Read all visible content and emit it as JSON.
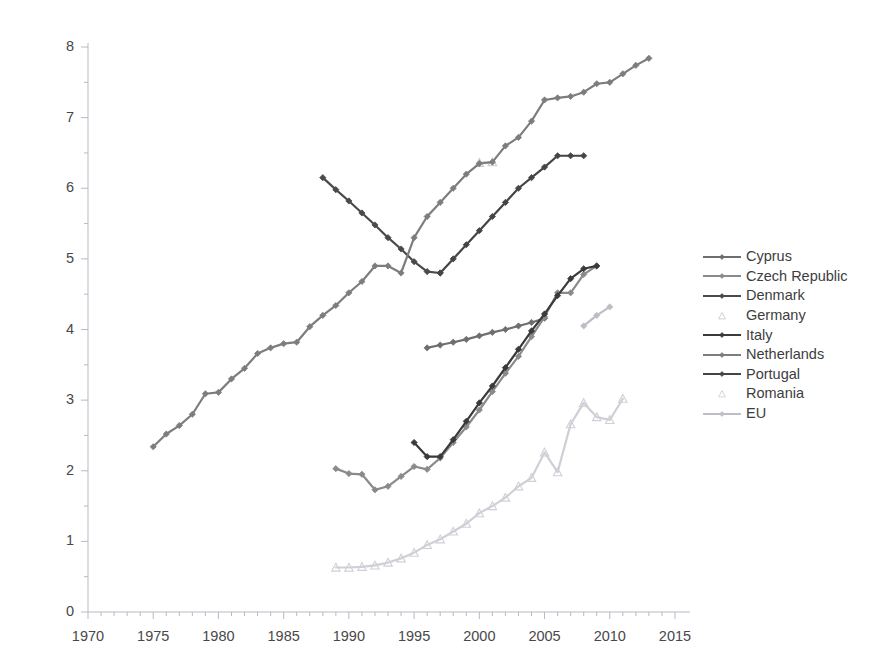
{
  "chart_data": {
    "type": "line",
    "title": "",
    "xlabel": "",
    "ylabel": "",
    "xlim": [
      1970,
      2015
    ],
    "ylim": [
      0,
      8
    ],
    "xticks": [
      1970,
      1975,
      1980,
      1985,
      1990,
      1995,
      2000,
      2005,
      2010,
      2015
    ],
    "yticks": [
      0,
      1,
      2,
      3,
      4,
      5,
      6,
      7,
      8
    ],
    "grid": false,
    "minor_xticks_every": 1,
    "minor_yticks_every": 0.5,
    "legend_position": "right",
    "series": [
      {
        "name": "Cyprus",
        "color": "#6e6e6e",
        "marker": "diamond",
        "x": [
          1996,
          1997,
          1998,
          1999,
          2000,
          2001,
          2002,
          2003,
          2004,
          2005
        ],
        "values": [
          3.74,
          3.78,
          3.82,
          3.86,
          3.91,
          3.96,
          4.0,
          4.05,
          4.1,
          4.16
        ]
      },
      {
        "name": "Czech Republic",
        "color": "#8a8a8a",
        "marker": "diamond",
        "x": [
          1989,
          1990,
          1991,
          1992,
          1993,
          1994,
          1995,
          1996,
          1997,
          1998,
          1999,
          2000,
          2001,
          2002,
          2003,
          2004,
          2005,
          2006,
          2007,
          2008,
          2009
        ],
        "values": [
          2.03,
          1.96,
          1.95,
          1.73,
          1.78,
          1.92,
          2.06,
          2.02,
          2.18,
          2.4,
          2.62,
          2.86,
          3.12,
          3.38,
          3.62,
          3.9,
          4.18,
          4.52,
          4.52,
          4.78,
          4.9
        ]
      },
      {
        "name": "Denmark",
        "color": "#4a4a4a",
        "marker": "diamond",
        "x": [
          1988,
          1989,
          1990,
          1991,
          1992,
          1993,
          1994,
          1995,
          1996,
          1997
        ],
        "values": [
          6.15,
          5.98,
          5.82,
          5.65,
          5.48,
          5.3,
          5.14,
          4.96,
          4.82,
          4.8
        ]
      },
      {
        "name": "Germany",
        "color": "#c9c9cf",
        "marker": "triangle",
        "x": [
          2000,
          2001
        ],
        "values": [
          6.36,
          6.37
        ]
      },
      {
        "name": "Italy",
        "color": "#3a3a3a",
        "marker": "diamond",
        "x": [
          1995,
          1996,
          1997,
          1998,
          1999,
          2000,
          2001,
          2002,
          2003,
          2004,
          2005,
          2006,
          2007,
          2008,
          2009
        ],
        "values": [
          2.4,
          2.2,
          2.2,
          2.44,
          2.7,
          2.96,
          3.2,
          3.46,
          3.72,
          3.98,
          4.22,
          4.48,
          4.72,
          4.86,
          4.9
        ]
      },
      {
        "name": "Netherlands",
        "color": "#7d7d7d",
        "marker": "diamond",
        "x": [
          1975,
          1976,
          1977,
          1978,
          1979,
          1980,
          1981,
          1982,
          1983,
          1984,
          1985,
          1986,
          1987,
          1988,
          1989,
          1990,
          1991,
          1992,
          1993,
          1994,
          1995,
          1996,
          1997,
          1998,
          1999,
          2000,
          2001,
          2002,
          2003,
          2004,
          2005,
          2006,
          2007,
          2008,
          2009,
          2010,
          2011,
          2012,
          2013
        ],
        "values": [
          2.34,
          2.52,
          2.64,
          2.8,
          3.09,
          3.11,
          3.3,
          3.45,
          3.66,
          3.74,
          3.8,
          3.82,
          4.04,
          4.2,
          4.34,
          4.52,
          4.68,
          4.9,
          4.9,
          4.8,
          5.3,
          5.6,
          5.8,
          6.0,
          6.2,
          6.35,
          6.37,
          6.6,
          6.72,
          6.95,
          7.25,
          7.28,
          7.3,
          7.36,
          7.48,
          7.5,
          7.62,
          7.74,
          7.84
        ]
      },
      {
        "name": "Portugal",
        "color": "#454545",
        "marker": "diamond",
        "x": [
          1997,
          1998,
          1999,
          2000,
          2001,
          2002,
          2003,
          2004,
          2005,
          2006,
          2007,
          2008
        ],
        "values": [
          4.8,
          5.0,
          5.2,
          5.4,
          5.6,
          5.8,
          6.0,
          6.15,
          6.3,
          6.46,
          6.46,
          6.46
        ]
      },
      {
        "name": "Romania",
        "color": "#cfcfd6",
        "marker": "triangle",
        "x": [
          1989,
          1990,
          1991,
          1992,
          1993,
          1994,
          1995,
          1996,
          1997,
          1998,
          1999,
          2000,
          2001,
          2002,
          2003,
          2004,
          2005,
          2006,
          2007,
          2008,
          2009,
          2010,
          2011
        ],
        "values": [
          0.63,
          0.63,
          0.64,
          0.66,
          0.7,
          0.76,
          0.84,
          0.95,
          1.03,
          1.14,
          1.25,
          1.4,
          1.5,
          1.62,
          1.78,
          1.9,
          2.26,
          1.98,
          2.66,
          2.96,
          2.76,
          2.72,
          3.02
        ]
      },
      {
        "name": "EU",
        "color": "#bdbdc6",
        "marker": "diamond",
        "x": [
          2008,
          2009,
          2010
        ],
        "values": [
          4.05,
          4.2,
          4.32
        ]
      }
    ]
  },
  "axes": {
    "y_tick_labels": [
      "8",
      "7",
      "6",
      "5",
      "4",
      "3",
      "2",
      "1",
      "0"
    ],
    "x_tick_labels": [
      "1970",
      "1975",
      "1980",
      "1985",
      "1990",
      "1995",
      "2000",
      "2005",
      "2010",
      "2015"
    ]
  },
  "legend": {
    "items": [
      {
        "label": "Cyprus",
        "color": "#6e6e6e",
        "marker": "diamond"
      },
      {
        "label": "Czech Republic",
        "color": "#8a8a8a",
        "marker": "diamond"
      },
      {
        "label": "Denmark",
        "color": "#4a4a4a",
        "marker": "diamond"
      },
      {
        "label": "Germany",
        "color": "#c9c9cf",
        "marker": "triangle"
      },
      {
        "label": "Italy",
        "color": "#3a3a3a",
        "marker": "diamond"
      },
      {
        "label": "Netherlands",
        "color": "#7d7d7d",
        "marker": "diamond"
      },
      {
        "label": "Portugal",
        "color": "#454545",
        "marker": "diamond"
      },
      {
        "label": "Romania",
        "color": "#cfcfd6",
        "marker": "triangle"
      },
      {
        "label": "EU",
        "color": "#bdbdc6",
        "marker": "diamond"
      }
    ]
  },
  "colors": {
    "axis": "#b9b9c4",
    "tick_text": "#484848",
    "background": "#ffffff"
  }
}
